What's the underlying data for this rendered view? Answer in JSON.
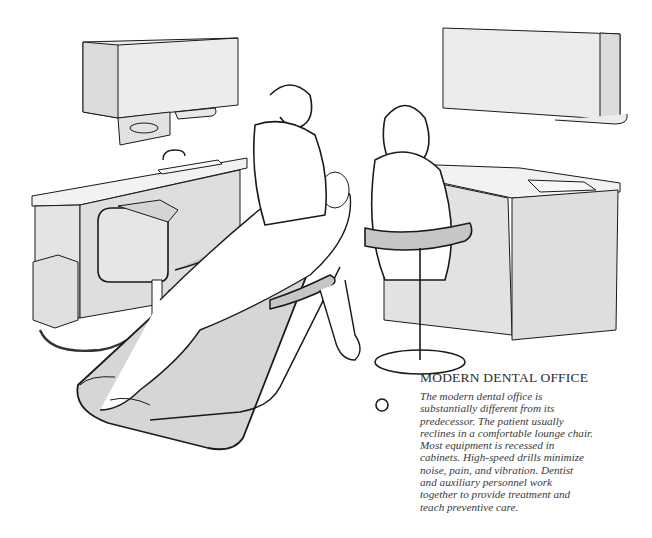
{
  "caption": {
    "title": "MODERN DENTAL OFFICE",
    "lines": [
      "The modern dental office is",
      "substantially different from its",
      "predecessor. The patient usually",
      "reclines in a comfortable lounge chair.",
      "Most equipment is recessed in",
      "cabinets. High-speed drills minimize",
      "noise, pain, and vibration. Dentist",
      "and auxiliary personnel work",
      "together to provide treatment and",
      "teach preventive care."
    ]
  },
  "illustration": {
    "subject": "dental office scene",
    "elements": [
      "wall cabinet left",
      "paper towel dispenser",
      "counter with sink left",
      "dental unit",
      "dentist",
      "patient in reclining chair",
      "assistant on stool",
      "wall cabinet right",
      "counter with sink right"
    ],
    "colors": {
      "line": "#1a1a1a",
      "fill_light": "#ececec",
      "fill_mid": "#d9d9d9",
      "fill_dark": "#c6c6c6",
      "background": "#ffffff"
    }
  }
}
